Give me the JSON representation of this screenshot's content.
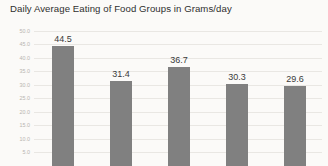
{
  "chart_data": {
    "type": "bar",
    "title": "Daily Average Eating of Food Groups in Grams/day",
    "xlabel": "",
    "ylabel": "",
    "categories": [
      "",
      "",
      "",
      "",
      ""
    ],
    "values": [
      44.5,
      31.4,
      36.7,
      30.3,
      29.6
    ],
    "value_labels": [
      "44.5",
      "31.4",
      "36.7",
      "30.3",
      "29.6"
    ],
    "ylim": [
      0,
      50
    ],
    "ytick_values": [
      50.0,
      45.0,
      40.0,
      35.0,
      30.0,
      25.0,
      20.0,
      15.0,
      10.0,
      5.0
    ],
    "ytick_labels": [
      "50.0",
      "45.0",
      "40.0",
      "35.0",
      "30.0",
      "25.0",
      "20.0",
      "15.0",
      "10.0",
      "5.0"
    ],
    "grid": true,
    "legend": false,
    "legend_position": "none",
    "bar_color": "#808080",
    "gridline_color": "#e9e7e3",
    "background_color": "#fbfaf8",
    "title_color": "#2f2f2f",
    "tick_label_color": "#b8b5b0",
    "value_label_color": "#3a3a3a"
  }
}
